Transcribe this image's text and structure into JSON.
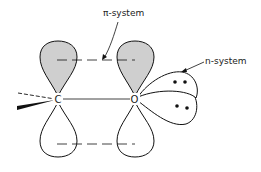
{
  "diagram": {
    "type": "molecular-orbital-diagram",
    "labels": {
      "pi_system": "π-system",
      "n_system": "n-system"
    },
    "atoms": [
      {
        "symbol": "C",
        "x": 58,
        "y": 99
      },
      {
        "symbol": "O",
        "x": 135,
        "y": 99
      }
    ],
    "colors": {
      "shaded_lobe": "#cfcfcf",
      "stroke": "#111111",
      "background": "#ffffff"
    },
    "lone_pairs": 2
  }
}
